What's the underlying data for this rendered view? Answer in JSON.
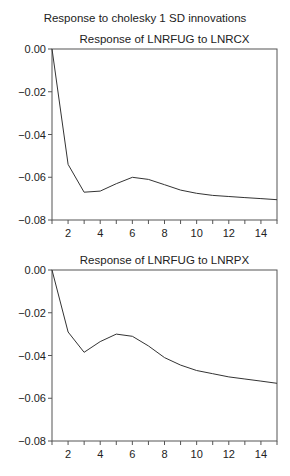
{
  "suptitle": "Response to cholesky 1 SD innovations",
  "chart_data": [
    {
      "type": "line",
      "title": "Response of LNRFUG to LNRCX",
      "xlabel": "",
      "ylabel": "",
      "x": [
        1,
        2,
        3,
        4,
        5,
        6,
        7,
        8,
        9,
        10,
        11,
        12,
        13,
        14,
        15
      ],
      "series": [
        {
          "name": "LNRFUG response to LNRCX",
          "values": [
            0.0,
            -0.054,
            -0.067,
            -0.0665,
            -0.063,
            -0.06,
            -0.061,
            -0.0635,
            -0.066,
            -0.0675,
            -0.0685,
            -0.069,
            -0.0695,
            -0.07,
            -0.0705
          ]
        }
      ],
      "ylim": [
        -0.08,
        0.0
      ],
      "xlim": [
        1,
        15
      ],
      "yticks": [
        "0.00",
        "−0.02",
        "−0.04",
        "−0.06",
        "−0.08"
      ],
      "xticks": [
        "2",
        "4",
        "6",
        "8",
        "10",
        "12",
        "14"
      ],
      "grid": false,
      "legend": "none"
    },
    {
      "type": "line",
      "title": "Response of LNRFUG to LNRPX",
      "xlabel": "",
      "ylabel": "",
      "x": [
        1,
        2,
        3,
        4,
        5,
        6,
        7,
        8,
        9,
        10,
        11,
        12,
        13,
        14,
        15
      ],
      "series": [
        {
          "name": "LNRFUG response to LNRPX",
          "values": [
            0.0,
            -0.029,
            -0.0385,
            -0.0335,
            -0.03,
            -0.031,
            -0.0355,
            -0.041,
            -0.0445,
            -0.047,
            -0.0485,
            -0.05,
            -0.051,
            -0.052,
            -0.053
          ]
        }
      ],
      "ylim": [
        -0.08,
        0.0
      ],
      "xlim": [
        1,
        15
      ],
      "yticks": [
        "0.00",
        "−0.02",
        "−0.04",
        "−0.06",
        "−0.08"
      ],
      "xticks": [
        "2",
        "4",
        "6",
        "8",
        "10",
        "12",
        "14"
      ],
      "grid": false,
      "legend": "none"
    }
  ],
  "colors": {
    "line": "#333333",
    "axis": "#555555",
    "text": "#222222"
  }
}
